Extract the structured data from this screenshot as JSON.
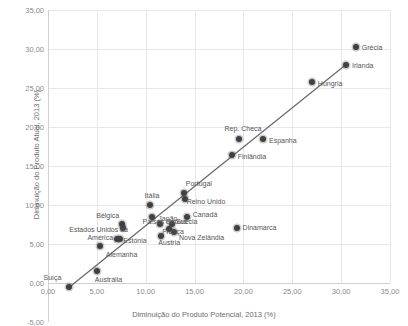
{
  "chart_data": {
    "type": "scatter",
    "title": "",
    "xlabel": "Diminuição do Produto Potencial, 2013 (%)",
    "ylabel": "Diminuição do Produto Atual, 2013 (%)",
    "xlim": [
      0,
      35
    ],
    "ylim": [
      -5,
      35
    ],
    "xticks": [
      "0,00",
      "5,00",
      "10,00",
      "15,00",
      "20,00",
      "25,00",
      "30,00",
      "35,00"
    ],
    "xtick_values": [
      0,
      5,
      10,
      15,
      20,
      25,
      30,
      35
    ],
    "yticks": [
      "-5,00",
      "0,00",
      "5,00",
      "10,00",
      "15,00",
      "20,00",
      "25,00",
      "30,00",
      "35,00"
    ],
    "ytick_values": [
      -5,
      0,
      5,
      10,
      15,
      20,
      25,
      30,
      35
    ],
    "grid": true,
    "legend": "none",
    "marker_color": "#404040",
    "trendline": {
      "visible": true,
      "color": "#6b6b6b",
      "x_start": 2.2,
      "y_start": -0.5,
      "x_end": 30.6,
      "y_end": 28.1
    },
    "points": [
      {
        "label": "Suíça",
        "x": 2.2,
        "y": -0.5,
        "label_dx": -26,
        "label_dy": -9
      },
      {
        "label": "Austrália",
        "x": 5.0,
        "y": 1.5,
        "label_dx": -2,
        "label_dy": 9
      },
      {
        "label": "Alemanha",
        "x": 5.3,
        "y": 4.8,
        "label_dx": 6,
        "label_dy": 9
      },
      {
        "label": "América",
        "x": 7.1,
        "y": 5.7,
        "label_dx": -30,
        "label_dy": -1
      },
      {
        "label": "Estónia",
        "x": 7.4,
        "y": 5.6,
        "label_dx": 3,
        "label_dy": 2
      },
      {
        "label": "Bélgica",
        "x": 7.6,
        "y": 7.6,
        "label_dx": -26,
        "label_dy": -8
      },
      {
        "label": "Estados Unidos da",
        "x": 7.7,
        "y": 7.0,
        "label_dx": -54,
        "label_dy": 2
      },
      {
        "label": "Itália",
        "x": 10.4,
        "y": 10.0,
        "label_dx": -5,
        "label_dy": -9
      },
      {
        "label": "Países Baixos",
        "x": 10.6,
        "y": 8.5,
        "label_dx": -9,
        "label_dy": 5
      },
      {
        "label": "Japão",
        "x": 11.5,
        "y": 7.6,
        "label_dx": -2,
        "label_dy": -5
      },
      {
        "label": "Áustria",
        "x": 11.6,
        "y": 6.0,
        "label_dx": -3,
        "label_dy": 7
      },
      {
        "label": "França",
        "x": 12.4,
        "y": 6.9,
        "label_dx": -7,
        "label_dy": 3
      },
      {
        "label": "Suécia",
        "x": 12.7,
        "y": 7.6,
        "label_dx": 4,
        "label_dy": -2
      },
      {
        "label": "Nova Zelândia",
        "x": 12.9,
        "y": 6.6,
        "label_dx": 5,
        "label_dy": 6
      },
      {
        "label": "Canadá",
        "x": 14.2,
        "y": 8.4,
        "label_dx": 6,
        "label_dy": -2
      },
      {
        "label": "Portugal",
        "x": 13.9,
        "y": 11.6,
        "label_dx": 2,
        "label_dy": -9
      },
      {
        "label": "Reino Unido",
        "x": 14.0,
        "y": 10.8,
        "label_dx": 2,
        "label_dy": 3
      },
      {
        "label": "Finlândia",
        "x": 18.8,
        "y": 16.4,
        "label_dx": 6,
        "label_dy": 2
      },
      {
        "label": "Rep. Checa",
        "x": 19.5,
        "y": 18.4,
        "label_dx": -14,
        "label_dy": -10
      },
      {
        "label": "Espanha",
        "x": 22.0,
        "y": 18.4,
        "label_dx": 6,
        "label_dy": 2
      },
      {
        "label": "Dinamarca",
        "x": 19.3,
        "y": 7.0,
        "label_dx": 6,
        "label_dy": 0
      },
      {
        "label": "Hungria",
        "x": 27.0,
        "y": 25.8,
        "label_dx": 6,
        "label_dy": 2
      },
      {
        "label": "Irlanda",
        "x": 30.5,
        "y": 28.0,
        "label_dx": 6,
        "label_dy": 1
      },
      {
        "label": "Grécia",
        "x": 31.5,
        "y": 30.2,
        "label_dx": 6,
        "label_dy": 1
      }
    ]
  }
}
